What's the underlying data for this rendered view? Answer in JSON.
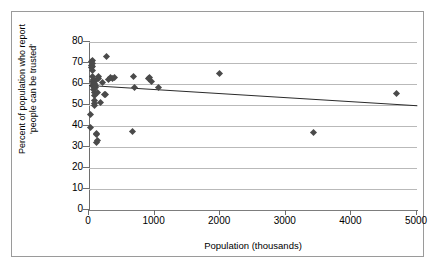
{
  "chart_data": {
    "type": "scatter",
    "title": "",
    "xlabel": "Population (thousands)",
    "ylabel_line1": "Percent of population who report",
    "ylabel_line2": "'people can be trusted'",
    "xlim": [
      0,
      5000
    ],
    "ylim": [
      0,
      80
    ],
    "xticks": [
      0,
      1000,
      2000,
      3000,
      4000,
      5000
    ],
    "yticks": [
      0,
      10,
      20,
      30,
      40,
      50,
      60,
      70,
      80
    ],
    "grid": "horizontal",
    "legend": "none",
    "marker": "diamond",
    "marker_color": "#4a4a4a",
    "trendline": {
      "type": "linear",
      "x": [
        0,
        5000
      ],
      "y": [
        59.6,
        50.0
      ],
      "color": "#2b2b2b"
    },
    "points": [
      [
        20,
        39.2
      ],
      [
        30,
        45.3
      ],
      [
        35,
        69.0
      ],
      [
        40,
        70.5
      ],
      [
        45,
        67.8
      ],
      [
        48,
        66.2
      ],
      [
        50,
        71.0
      ],
      [
        52,
        63.5
      ],
      [
        55,
        69.6
      ],
      [
        58,
        68.4
      ],
      [
        60,
        61.0
      ],
      [
        62,
        59.8
      ],
      [
        65,
        58.9
      ],
      [
        68,
        60.4
      ],
      [
        70,
        57.5
      ],
      [
        72,
        62.0
      ],
      [
        75,
        59.0
      ],
      [
        78,
        56.0
      ],
      [
        80,
        54.5
      ],
      [
        82,
        60.2
      ],
      [
        85,
        52.0
      ],
      [
        88,
        50.6
      ],
      [
        90,
        49.8
      ],
      [
        95,
        58.3
      ],
      [
        100,
        59.4
      ],
      [
        105,
        61.5
      ],
      [
        110,
        36.5
      ],
      [
        115,
        36.0
      ],
      [
        120,
        32.3
      ],
      [
        125,
        33.0
      ],
      [
        130,
        55.8
      ],
      [
        140,
        62.8
      ],
      [
        150,
        63.4
      ],
      [
        170,
        51.3
      ],
      [
        200,
        60.8
      ],
      [
        230,
        54.9
      ],
      [
        250,
        55.2
      ],
      [
        270,
        72.9
      ],
      [
        300,
        62.3
      ],
      [
        330,
        63.1
      ],
      [
        360,
        62.6
      ],
      [
        390,
        63.2
      ],
      [
        670,
        37.5
      ],
      [
        680,
        63.4
      ],
      [
        700,
        58.3
      ],
      [
        900,
        62.4
      ],
      [
        920,
        63.3
      ],
      [
        950,
        61.3
      ],
      [
        1060,
        58.3
      ],
      [
        1990,
        64.8
      ],
      [
        3420,
        37.0
      ],
      [
        4680,
        55.3
      ]
    ]
  }
}
